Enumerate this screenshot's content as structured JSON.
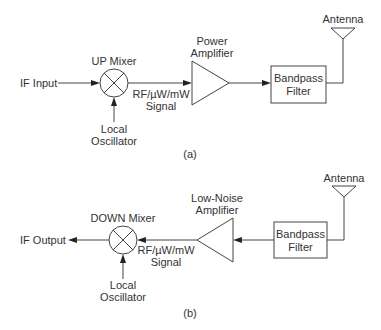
{
  "diagrams": {
    "a": {
      "caption": "(a)",
      "input_label": "IF Input",
      "mixer": {
        "label": "UP Mixer",
        "icon": "mixer-x-circle"
      },
      "lo": {
        "line1": "Local",
        "line2": "Oscillator"
      },
      "signal": {
        "line1": "RF/µW/mW",
        "line2": "Signal"
      },
      "amplifier": {
        "line1": "Power",
        "line2": "Amplifier",
        "direction": "right"
      },
      "filter": {
        "line1": "Bandpass",
        "line2": "Filter"
      },
      "antenna": {
        "label": "Antenna"
      }
    },
    "b": {
      "caption": "(b)",
      "output_label": "IF Output",
      "mixer": {
        "label": "DOWN Mixer",
        "icon": "mixer-x-circle"
      },
      "lo": {
        "line1": "Local",
        "line2": "Oscillator"
      },
      "signal": {
        "line1": "RF/µW/mW",
        "line2": "Signal"
      },
      "amplifier": {
        "line1": "Low-Noise",
        "line2": "Amplifier",
        "direction": "left"
      },
      "filter": {
        "line1": "Bandpass",
        "line2": "Filter"
      },
      "antenna": {
        "label": "Antenna"
      }
    }
  },
  "colors": {
    "line": "#444444",
    "text": "#333333",
    "background": "#ffffff"
  }
}
